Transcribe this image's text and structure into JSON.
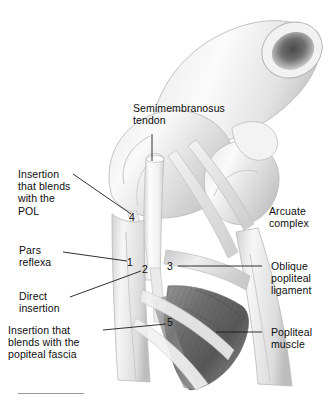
{
  "figure": {
    "background_color": "#ffffff",
    "ink_color": "#0d0d0d",
    "leader_color": "#1a1a1a",
    "rule_color": "#9a9a9a"
  },
  "labels": {
    "semimembranosus_tendon": "Semimembranosus\ntendon",
    "insertion_pol": "Insertion\nthat blends\nwith the\nPOL",
    "pars_reflexa": "Pars\nreflexa",
    "direct_insertion": "Direct\ninsertion",
    "insertion_fascia": "Insertion that\nblends with the\npopiteal fascia",
    "arcuate_complex": "Arcuate\ncomplex",
    "oblique_popliteal_ligament": "Oblique\npopliteal\nligament",
    "popliteal_muscle": "Popliteal\nmuscle"
  },
  "callout_numbers": {
    "n1": "1",
    "n2": "2",
    "n3": "3",
    "n4": "4",
    "n5": "5"
  },
  "anatomy_parts": [
    "femur-shaft-cross-section",
    "medial-femoral-condyle",
    "lateral-femoral-condyle",
    "semimembranosus-tendon",
    "tibia-shaft",
    "popliteal-muscle",
    "oblique-popliteal-ligament",
    "arcuate-complex",
    "fibula"
  ]
}
